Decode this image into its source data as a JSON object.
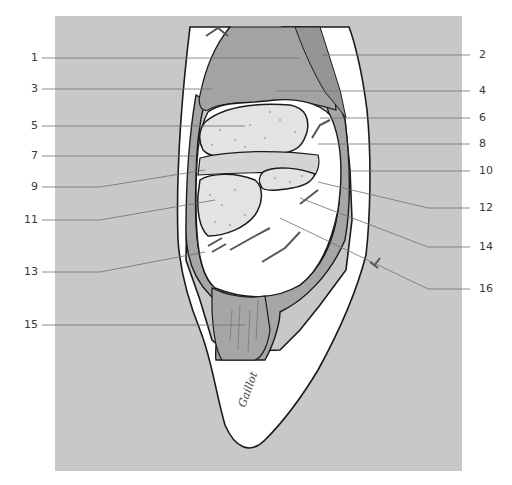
{
  "figure": {
    "type": "anatomical cross-section illustration",
    "colors": {
      "panel_background": "#c8c8c8",
      "page_background": "#ffffff",
      "skin_white": "#ffffff",
      "muscle_gray": "#a6a6a6",
      "dark_muscle_gray": "#9a9a9a",
      "bone_light": "#e3e3e3",
      "cartilage_light": "#d4d4d4",
      "outline": "#1a1a1a",
      "leader_line": "#6e6e6e"
    },
    "signature": "Gaillot"
  },
  "labels": {
    "left": [
      {
        "num": "1",
        "y": 58
      },
      {
        "num": "3",
        "y": 89
      },
      {
        "num": "5",
        "y": 126
      },
      {
        "num": "7",
        "y": 156
      },
      {
        "num": "9",
        "y": 187
      },
      {
        "num": "11",
        "y": 220
      },
      {
        "num": "13",
        "y": 272
      },
      {
        "num": "15",
        "y": 325
      }
    ],
    "right": [
      {
        "num": "2",
        "y": 55
      },
      {
        "num": "4",
        "y": 91
      },
      {
        "num": "6",
        "y": 118
      },
      {
        "num": "8",
        "y": 144
      },
      {
        "num": "10",
        "y": 171
      },
      {
        "num": "12",
        "y": 208
      },
      {
        "num": "14",
        "y": 247
      },
      {
        "num": "16",
        "y": 289
      }
    ]
  }
}
